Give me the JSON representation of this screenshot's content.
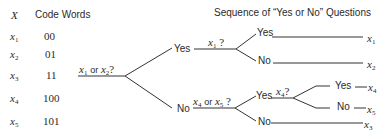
{
  "header": {
    "x_label": "X",
    "code_words_label": "Code Words",
    "questions_title": "Sequence of “Yes or No” Questions"
  },
  "code_table": [
    {
      "symbol": "x",
      "sub": "1",
      "code": "00"
    },
    {
      "symbol": "x",
      "sub": "2",
      "code": "01"
    },
    {
      "symbol": "x",
      "sub": "3",
      "code": "11"
    },
    {
      "symbol": "x",
      "sub": "4",
      "code": "100"
    },
    {
      "symbol": "x",
      "sub": "5",
      "code": "101"
    }
  ],
  "tree": {
    "root_question": {
      "a": "x",
      "a_sub": "1",
      "or": "or",
      "b": "x",
      "b_sub": "2",
      "q": "?"
    },
    "yes_label": "Yes",
    "no_label": "No",
    "yes_branch_question": {
      "a": "x",
      "a_sub": "1",
      "q": "?"
    },
    "no_branch_question": {
      "a": "x",
      "a_sub": "4",
      "or": "or",
      "b": "x",
      "b_sub": "5",
      "q": "?"
    },
    "deep_question": {
      "a": "x",
      "a_sub": "4",
      "q": "?"
    },
    "leaves": {
      "x1": {
        "symbol": "x",
        "sub": "1"
      },
      "x2": {
        "symbol": "x",
        "sub": "2"
      },
      "x3": {
        "symbol": "x",
        "sub": "3"
      },
      "x4": {
        "symbol": "x",
        "sub": "4"
      },
      "x5": {
        "symbol": "x",
        "sub": "5"
      }
    }
  }
}
